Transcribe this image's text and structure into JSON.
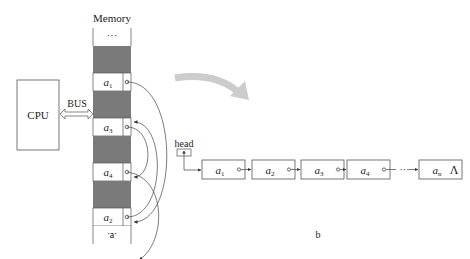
{
  "diagram_a": {
    "memory_title": "Memory",
    "cpu_label": "CPU",
    "bus_label": "BUS",
    "ellipsis": "···",
    "cells": [
      {
        "kind": "ellipsis"
      },
      {
        "kind": "used"
      },
      {
        "kind": "node",
        "base": "a",
        "sub": "1"
      },
      {
        "kind": "used"
      },
      {
        "kind": "node",
        "base": "a",
        "sub": "3"
      },
      {
        "kind": "used"
      },
      {
        "kind": "node",
        "base": "a",
        "sub": "4"
      },
      {
        "kind": "used"
      },
      {
        "kind": "node",
        "base": "a",
        "sub": "2"
      },
      {
        "kind": "ellipsis"
      }
    ],
    "links": [
      {
        "from": "1",
        "to": "2"
      },
      {
        "from": "2",
        "to": "3"
      },
      {
        "from": "3",
        "to": "4"
      },
      {
        "from": "4",
        "to": "next"
      }
    ],
    "caption": "a"
  },
  "diagram_b": {
    "head_label": "head",
    "nodes": [
      {
        "base": "a",
        "sub": "1"
      },
      {
        "base": "a",
        "sub": "2"
      },
      {
        "base": "a",
        "sub": "3"
      },
      {
        "base": "a",
        "sub": "4"
      },
      {
        "base": "a",
        "sub": "n"
      }
    ],
    "gap_ellipsis": "···",
    "null_symbol": "Λ",
    "caption": "b"
  },
  "colors": {
    "line": "#555555",
    "used_cell": "#7a7a7a",
    "transition_arrow": "#cccccc"
  }
}
